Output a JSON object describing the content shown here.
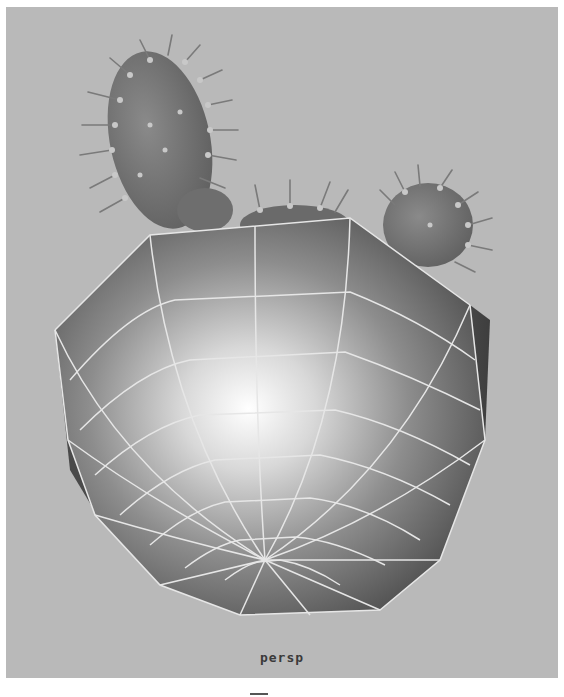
{
  "viewport": {
    "camera_label": "persp",
    "background_color": "#b9b9b9",
    "wireframe_color": "#e8e8e8",
    "scene_objects": [
      {
        "name": "cactus-pad-large",
        "type": "mesh"
      },
      {
        "name": "cactus-pad-small-left",
        "type": "mesh"
      },
      {
        "name": "cactus-pad-center",
        "type": "mesh"
      },
      {
        "name": "cactus-pad-right",
        "type": "mesh"
      },
      {
        "name": "flower-pot",
        "type": "polygon-mesh",
        "display": "shaded-with-wireframe"
      }
    ]
  }
}
